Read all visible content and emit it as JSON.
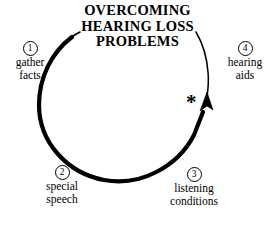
{
  "diagram": {
    "title_lines": [
      "OVERCOMING",
      "HEARING LOSS",
      "PROBLEMS"
    ],
    "title_full": "OVERCOMING HEARING LOSS PROBLEMS",
    "annotation": {
      "asterisk": "*"
    },
    "colors": {
      "ink": "#000000",
      "background": "#ffffff"
    },
    "arrow": {
      "direction": "counterclockwise",
      "head_position": "upper-right"
    },
    "steps": [
      {
        "number": "1",
        "line1": "gather",
        "line2": "facts",
        "label": "gather facts"
      },
      {
        "number": "2",
        "line1": "special",
        "line2": "speech",
        "label": "special speech"
      },
      {
        "number": "3",
        "line1": "listening",
        "line2": "conditions",
        "label": "listening conditions"
      },
      {
        "number": "4",
        "line1": "hearing",
        "line2": "aids",
        "label": "hearing aids"
      }
    ]
  }
}
